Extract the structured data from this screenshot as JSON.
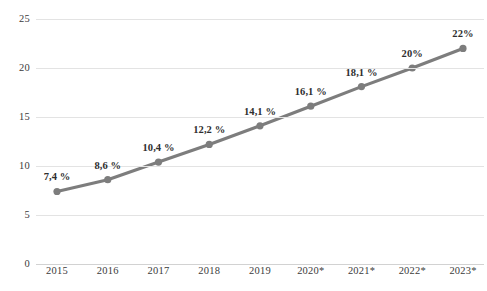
{
  "chart_data": {
    "type": "line",
    "title": "",
    "subtitle": "",
    "xlabel": "",
    "ylabel": "",
    "categories": [
      "2015",
      "2016",
      "2017",
      "2018",
      "2019",
      "2020*",
      "2021*",
      "2022*",
      "2023*"
    ],
    "values": [
      7.4,
      8.6,
      10.4,
      12.2,
      14.1,
      16.1,
      18.1,
      20,
      22
    ],
    "point_labels": [
      "7,4 %",
      "8,6 %",
      "10,4 %",
      "12,2 %",
      "14,1 %",
      "16,1 %",
      "18,1 %",
      "20%",
      "22%"
    ],
    "ylim": [
      0,
      25
    ],
    "yticks": [
      0,
      5,
      10,
      15,
      20,
      25
    ],
    "ytick_labels": [
      "0",
      "5",
      "10",
      "15",
      "20",
      "25"
    ],
    "grid": true,
    "grid_axis": "y",
    "legend": false,
    "legend_position": "none",
    "series": [
      {
        "name": "",
        "values": [
          7.4,
          8.6,
          10.4,
          12.2,
          14.1,
          16.1,
          18.1,
          20,
          22
        ],
        "color": "#7d7d7d",
        "marker": "circle"
      }
    ],
    "colors": {
      "line": "#7d7d7d",
      "marker": "#7d7d7d",
      "gridline": "#e3e3e3",
      "baseline": "#d2d2d2",
      "text": "#3b3b3b",
      "label_text": "#2e2e2e",
      "background": "#ffffff"
    }
  }
}
